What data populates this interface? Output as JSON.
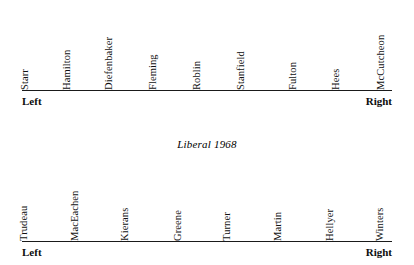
{
  "figure": {
    "background_color": "#ffffff",
    "axis_color": "#1a1a1a",
    "text_color": "#111111"
  },
  "chart_data": {
    "type": "scatter",
    "title": "",
    "xlabel": "",
    "ylabel": "",
    "charts": [
      {
        "title": "",
        "axis_left_label": "Left",
        "axis_right_label": "Right",
        "axis_x_start": 22,
        "axis_x_end": 392,
        "categories": [
          "Starr",
          "Hamilton",
          "Diefenbaker",
          "Fleming",
          "Roblin",
          "Stanfield",
          "Fulton",
          "Hees",
          "McCutcheon"
        ],
        "positions": [
          30,
          72,
          114,
          158,
          202,
          246,
          298,
          341,
          386
        ]
      },
      {
        "title": "Liberal 1968",
        "axis_left_label": "Left",
        "axis_right_label": "Right",
        "axis_x_start": 22,
        "axis_x_end": 392,
        "categories": [
          "Trudeau",
          "MacEachen",
          "Kierans",
          "Greene",
          "Turner",
          "Martin",
          "Hellyer",
          "Winters"
        ],
        "positions": [
          29,
          80,
          130,
          183,
          232,
          283,
          335,
          385
        ]
      }
    ]
  },
  "scales": [
    {
      "title": "",
      "title_top": -100,
      "band_top": 8,
      "band_height": 82,
      "axis_top": 90,
      "axis_left": 22,
      "axis_width": 370,
      "endpoint_top": 95,
      "left_label": "Left",
      "right_label": "Right",
      "left_label_x": 22,
      "right_label_x": 392,
      "items": [
        {
          "label": "Starr",
          "x": 30
        },
        {
          "label": "Hamilton",
          "x": 72
        },
        {
          "label": "Diefenbaker",
          "x": 114
        },
        {
          "label": "Fleming",
          "x": 158
        },
        {
          "label": "Roblin",
          "x": 202
        },
        {
          "label": "Stanfield",
          "x": 246
        },
        {
          "label": "Fulton",
          "x": 298
        },
        {
          "label": "Hees",
          "x": 341
        },
        {
          "label": "McCutcheon",
          "x": 386
        }
      ]
    },
    {
      "title": "Liberal 1968",
      "title_top": 138,
      "band_top": 160,
      "band_height": 81,
      "axis_top": 241,
      "axis_left": 22,
      "axis_width": 370,
      "endpoint_top": 246,
      "left_label": "Left",
      "right_label": "Right",
      "left_label_x": 22,
      "right_label_x": 392,
      "items": [
        {
          "label": "Trudeau",
          "x": 29
        },
        {
          "label": "MacEachen",
          "x": 80
        },
        {
          "label": "Kierans",
          "x": 130
        },
        {
          "label": "Greene",
          "x": 183
        },
        {
          "label": "Turner",
          "x": 232
        },
        {
          "label": "Martin",
          "x": 283
        },
        {
          "label": "Hellyer",
          "x": 335
        },
        {
          "label": "Winters",
          "x": 385
        }
      ]
    }
  ]
}
